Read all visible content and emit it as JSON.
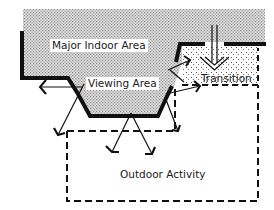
{
  "diagram": {
    "type": "spatial-relationship",
    "labels": {
      "major_indoor": "Major Indoor Area",
      "viewing": "Viewing Area",
      "transition": "Transition",
      "outdoor": "Outdoor Activity"
    },
    "colors": {
      "stipple": "#c8c8c8",
      "wall": "#111111",
      "line": "#222222",
      "background": "#ffffff"
    }
  }
}
